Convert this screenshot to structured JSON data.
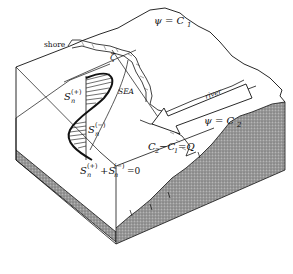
{
  "diagram": {
    "title": "",
    "labels": {
      "shore": "shore",
      "sea": "SEA",
      "river": "river",
      "zeta": "ζ",
      "psi_c1": "ψ = C",
      "psi_c1_sub": "1",
      "psi_c2": "ψ = C",
      "psi_c2_sub": "2",
      "s_plus": "S",
      "s_plus_sub": "n",
      "s_plus_sup": "(+)",
      "s_minus": "S",
      "s_minus_sub": "n",
      "s_minus_sup": "(−)",
      "sum_eq": "S",
      "sum_eq_sub1": "n",
      "sum_eq_sup1": "(+)",
      "sum_eq_mid": "+S",
      "sum_eq_sub2": "n",
      "sum_eq_sup2": "(−)",
      "sum_eq_end": "=0",
      "flux_eq_a": "C",
      "flux_eq_a_sub": "2",
      "flux_eq_b": "−C",
      "flux_eq_b_sub": "1",
      "flux_eq_c": "=Q"
    },
    "colors": {
      "line": "#111111",
      "shade": "#8a8a8a",
      "background": "#ffffff"
    }
  }
}
